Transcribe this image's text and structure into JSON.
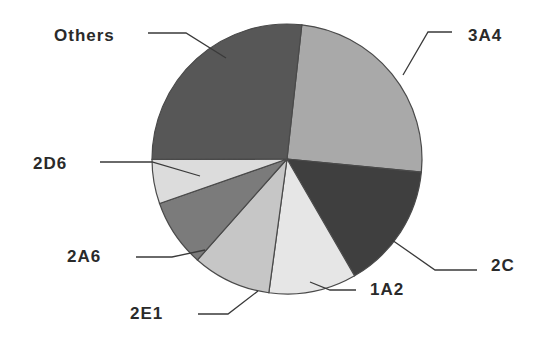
{
  "chart_data": {
    "type": "pie",
    "title": "",
    "start_angle_deg": 6.3,
    "direction": "clockwise",
    "center": [
      287,
      159
    ],
    "radius": 135,
    "slices": [
      {
        "label": "3A4",
        "value": 24.8,
        "color": "#a9a9a9"
      },
      {
        "label": "2C",
        "value": 15.1,
        "color": "#3f3f3f"
      },
      {
        "label": "1A2",
        "value": 10.5,
        "color": "#e6e6e6"
      },
      {
        "label": "2E1",
        "value": 9.4,
        "color": "#c6c6c6"
      },
      {
        "label": "2A6",
        "value": 8.1,
        "color": "#7b7b7b"
      },
      {
        "label": "2D6",
        "value": 5.3,
        "color": "#dcdcdc"
      },
      {
        "label": "Others",
        "value": 26.8,
        "color": "#575757"
      }
    ],
    "labels": [
      "3A4",
      "2C",
      "1A2",
      "2E1",
      "2A6",
      "2D6",
      "Others"
    ],
    "values": [
      24.8,
      15.1,
      10.5,
      9.4,
      8.1,
      5.3,
      26.8
    ],
    "legend": "none (leader-line labels)"
  },
  "label_layout": {
    "3A4": {
      "x": 468,
      "y": 34,
      "line": [
        [
          403,
          75
        ],
        [
          428,
          32
        ],
        [
          452,
          32
        ]
      ]
    },
    "2C": {
      "x": 491,
      "y": 264,
      "line": [
        [
          392,
          240
        ],
        [
          435,
          270
        ],
        [
          477,
          270
        ]
      ]
    },
    "1A2": {
      "x": 370,
      "y": 288,
      "line": [
        [
          310,
          282
        ],
        [
          330,
          290
        ],
        [
          356,
          290
        ]
      ]
    },
    "2E1": {
      "x": 130,
      "y": 312,
      "line": [
        [
          258,
          291
        ],
        [
          228,
          314
        ],
        [
          198,
          314
        ]
      ]
    },
    "2A6": {
      "x": 67,
      "y": 255,
      "line": [
        [
          205,
          250
        ],
        [
          172,
          257
        ],
        [
          136,
          257
        ]
      ]
    },
    "2D6": {
      "x": 33,
      "y": 162,
      "line": [
        [
          200,
          176
        ],
        [
          152,
          162
        ],
        [
          100,
          162
        ]
      ]
    },
    "Others": {
      "x": 54,
      "y": 34,
      "line": [
        [
          148,
          33
        ],
        [
          186,
          33
        ],
        [
          226,
          58
        ]
      ]
    }
  }
}
